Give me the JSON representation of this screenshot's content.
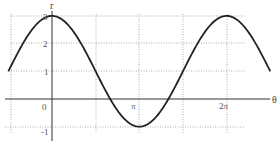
{
  "chart_data": {
    "type": "line",
    "title": "",
    "function": "r = 1 + 2cos(θ)",
    "xlabel": "θ",
    "ylabel": "r",
    "xlim": [
      -1.5708,
      7.854
    ],
    "ylim": [
      -1,
      3
    ],
    "x_ticks": [
      {
        "value": 0,
        "label": "0"
      },
      {
        "value": 3.14159,
        "label": "π"
      },
      {
        "value": 6.28319,
        "label": "2π"
      }
    ],
    "y_ticks": [
      {
        "value": -1,
        "label": "-1"
      },
      {
        "value": 1,
        "label": "1"
      },
      {
        "value": 2,
        "label": "2"
      },
      {
        "value": 3,
        "label": "3"
      }
    ],
    "grid": true,
    "grid_style": "dotted",
    "vertical_gridlines": [
      -1.5708,
      1.5708,
      3.14159,
      4.7124,
      6.28319
    ],
    "horizontal_gridlines": [
      -1,
      1,
      2,
      3
    ],
    "series": [
      {
        "name": "r = 1 + 2cos θ",
        "x": [
          -1.5708,
          -0.7854,
          0,
          0.7854,
          1.5708,
          2.3562,
          3.14159,
          3.927,
          4.7124,
          5.4978,
          6.28319,
          7.0686,
          7.854
        ],
        "values": [
          1,
          2.414,
          3,
          2.414,
          1,
          -0.414,
          -1,
          -0.414,
          1,
          2.414,
          3,
          2.414,
          1
        ]
      }
    ],
    "colors": {
      "curve": "#222222",
      "axis": "#333333",
      "grid": "#888888"
    }
  },
  "labels": {
    "r": "r",
    "theta": "θ",
    "zero": "0",
    "pi": "π",
    "two_pi": "2π",
    "y1": "1",
    "y2": "2",
    "y3": "3",
    "yneg1": "-1"
  }
}
